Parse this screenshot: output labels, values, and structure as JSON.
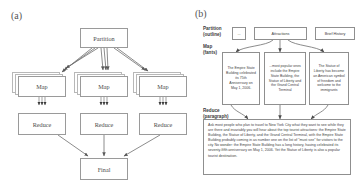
{
  "figure": {
    "panel_a": {
      "label": "(a)",
      "nodes": {
        "partition": "Partition",
        "map": "Map",
        "reduce": "Reduce",
        "final": "Final"
      },
      "map_count": 3,
      "reduce_count": 3,
      "map_stack_depth": 3
    },
    "panel_b": {
      "label": "(b)",
      "row_labels": {
        "partition": "Partition\n(outline)",
        "partition_line1": "Partition",
        "partition_line2": "(outline)",
        "map_line1": "Map",
        "map_line2": "(fants)",
        "reduce_line1": "Reduce",
        "reduce_line2": "(paragraph)"
      },
      "top_boxes": [
        "...",
        "Attractions",
        "Brief History"
      ],
      "map_boxes": [
        "The Empire State Building celebrated its 75th Anniversary on May 1, 2006.",
        "...most popular ones include the Empire State Building, the Statue of Liberty and the Grand Central Terminal",
        "The Statue of Liberty has become an American symbol of freedom and welcome to the immigrants"
      ],
      "paragraph": "Ask most people who plan to travel to New York City what they want to see while they are there and invariably you will hear about the top tourist attractions:  the Empire State Building, the Statue of Liberty, and the Grand Central Terminal, with the Empire State Building probably coming in as number one on the list of \"must see\" for visitors to the city  No wonder:  the Empire State Building has a long history, having celebrated its seventy-fifth anniversary on May 1, 2006.  Yet the Statue of Liberty is also a popular tourist destination."
    }
  },
  "colors": {
    "stroke": "#8f8f8f",
    "text": "#444444",
    "background": "#ffffff"
  }
}
